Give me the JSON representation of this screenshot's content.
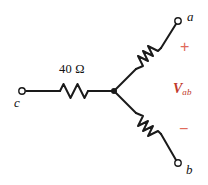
{
  "figure": {
    "type": "circuit-diagram",
    "background_color": "#ffffff",
    "wire_color": "#1a1a1a",
    "accent_color": "#c0392b",
    "polarity_color": "#e06a5a"
  },
  "terminals": [
    {
      "id": "a",
      "label": "a",
      "x": 178,
      "y": 21,
      "marker": "open-circle"
    },
    {
      "id": "b",
      "label": "b",
      "x": 178,
      "y": 163,
      "marker": "open-circle"
    },
    {
      "id": "c",
      "label": "c",
      "x": 22,
      "y": 91,
      "marker": "open-circle"
    }
  ],
  "junction": {
    "x": 114,
    "y": 91,
    "marker": "solid-dot"
  },
  "components": [
    {
      "id": "r-c",
      "type": "resistor",
      "label": "40 Ω",
      "value": "40",
      "unit": "Ω",
      "branch": "c"
    },
    {
      "id": "r-a",
      "type": "resistor",
      "label": "",
      "branch": "a"
    },
    {
      "id": "r-b",
      "type": "resistor",
      "label": "",
      "branch": "b"
    }
  ],
  "annotations": {
    "voltage_symbol": "V",
    "voltage_subscript": "ab",
    "polarity_plus": "+",
    "polarity_minus": "−"
  }
}
